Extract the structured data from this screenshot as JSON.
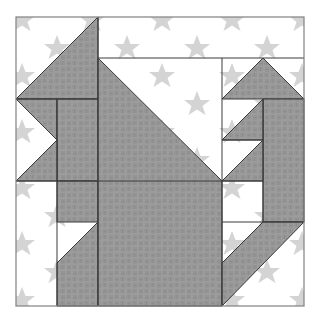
{
  "colors": {
    "background_fabric": "#ffffff",
    "star_print": "#d4d4d4",
    "feature_fabric": "#9c9c9c",
    "weave_pattern": "#858585",
    "seam_line": "#3a3a3a",
    "border": "#808080"
  },
  "pieces": {
    "ear": "cat ear",
    "head_body": "cat head and body",
    "tail_tip": "tail tip",
    "tail": "tail"
  }
}
